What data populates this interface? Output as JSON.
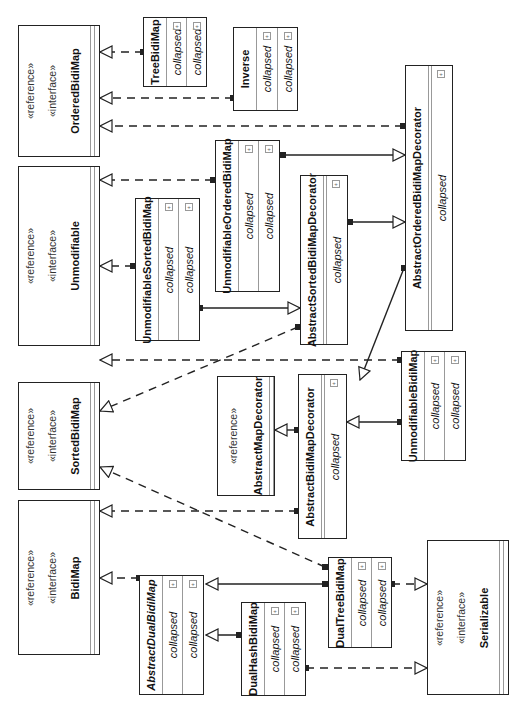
{
  "diagram": {
    "type": "uml-class-diagram",
    "orientation": "rotated-90-ccw",
    "colors": {
      "line": "#222222",
      "separator": "#999999",
      "background": "#ffffff"
    },
    "interfaces": [
      {
        "id": "ordered",
        "stereotypes": [
          "«reference»",
          "«interface»"
        ],
        "name": "OrderedBidiMap"
      },
      {
        "id": "unmod",
        "stereotypes": [
          "«reference»",
          "«interface»"
        ],
        "name": "Unmodifiable"
      },
      {
        "id": "sorted",
        "stereotypes": [
          "«reference»",
          "«interface»"
        ],
        "name": "SortedBidiMap"
      },
      {
        "id": "bidi",
        "stereotypes": [
          "«reference»",
          "«interface»"
        ],
        "name": "BidiMap"
      },
      {
        "id": "serial",
        "stereotypes": [
          "«reference»",
          "«interface»"
        ],
        "name": "Serializable"
      }
    ],
    "reference_classes": [
      {
        "id": "amd",
        "stereotypes": [
          "«reference»"
        ],
        "name": "AbstractMapDecorator"
      }
    ],
    "classes": [
      {
        "id": "tree",
        "name": "TreeBidiMap",
        "sections": [
          "collapsed",
          "collapsed"
        ]
      },
      {
        "id": "inverse",
        "name": "Inverse",
        "sections": [
          "collapsed",
          "collapsed"
        ]
      },
      {
        "id": "aobmd",
        "name": "AbstractOrderedBidiMapDecorator",
        "sections": [
          "collapsed"
        ]
      },
      {
        "id": "uobm",
        "name": "UnmodifiableOrderedBidiMap",
        "sections": [
          "collapsed",
          "collapsed"
        ]
      },
      {
        "id": "asbmd",
        "name": "AbstractSortedBidiMapDecorator",
        "sections": [
          "collapsed"
        ]
      },
      {
        "id": "usbm",
        "name": "UnmodifiableSortedBidiMap",
        "sections": [
          "collapsed",
          "collapsed"
        ]
      },
      {
        "id": "abmd",
        "name": "AbstractBidiMapDecorator",
        "sections": [
          "collapsed"
        ]
      },
      {
        "id": "ubm",
        "name": "UnmodifiableBidiMap",
        "sections": [
          "collapsed",
          "collapsed"
        ]
      },
      {
        "id": "adbm",
        "name": "AbstractDualBidiMap",
        "abstract": true,
        "sections": [
          "collapsed",
          "collapsed"
        ]
      },
      {
        "id": "dhbm",
        "name": "DualHashBidiMap",
        "sections": [
          "collapsed",
          "collapsed"
        ]
      },
      {
        "id": "dtbm",
        "name": "DualTreeBidiMap",
        "sections": [
          "collapsed",
          "collapsed"
        ]
      }
    ],
    "relations": [
      {
        "from": "TreeBidiMap",
        "to": "OrderedBidiMap",
        "kind": "realization"
      },
      {
        "from": "Inverse",
        "to": "OrderedBidiMap",
        "kind": "realization"
      },
      {
        "from": "AbstractOrderedBidiMapDecorator",
        "to": "OrderedBidiMap",
        "kind": "realization"
      },
      {
        "from": "UnmodifiableOrderedBidiMap",
        "to": "Unmodifiable",
        "kind": "realization"
      },
      {
        "from": "UnmodifiableOrderedBidiMap",
        "to": "AbstractOrderedBidiMapDecorator",
        "kind": "generalization"
      },
      {
        "from": "AbstractSortedBidiMapDecorator",
        "to": "AbstractOrderedBidiMapDecorator",
        "kind": "generalization"
      },
      {
        "from": "UnmodifiableSortedBidiMap",
        "to": "Unmodifiable",
        "kind": "realization"
      },
      {
        "from": "UnmodifiableSortedBidiMap",
        "to": "AbstractSortedBidiMapDecorator",
        "kind": "generalization"
      },
      {
        "from": "AbstractSortedBidiMapDecorator",
        "to": "SortedBidiMap",
        "kind": "realization"
      },
      {
        "from": "UnmodifiableBidiMap",
        "to": "Unmodifiable",
        "kind": "realization"
      },
      {
        "from": "UnmodifiableBidiMap",
        "to": "AbstractBidiMapDecorator",
        "kind": "generalization"
      },
      {
        "from": "AbstractOrderedBidiMapDecorator",
        "to": "AbstractBidiMapDecorator",
        "kind": "generalization"
      },
      {
        "from": "AbstractBidiMapDecorator",
        "to": "AbstractMapDecorator",
        "kind": "generalization"
      },
      {
        "from": "AbstractBidiMapDecorator",
        "to": "BidiMap",
        "kind": "realization"
      },
      {
        "from": "DualTreeBidiMap",
        "to": "SortedBidiMap",
        "kind": "realization"
      },
      {
        "from": "AbstractDualBidiMap",
        "to": "BidiMap",
        "kind": "realization"
      },
      {
        "from": "DualTreeBidiMap",
        "to": "AbstractDualBidiMap",
        "kind": "generalization"
      },
      {
        "from": "DualHashBidiMap",
        "to": "AbstractDualBidiMap",
        "kind": "generalization"
      },
      {
        "from": "DualTreeBidiMap",
        "to": "Serializable",
        "kind": "realization"
      },
      {
        "from": "DualHashBidiMap",
        "to": "Serializable",
        "kind": "realization"
      }
    ],
    "expand_icon": "+"
  }
}
